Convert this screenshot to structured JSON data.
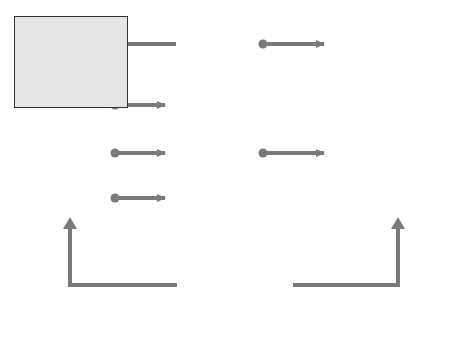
{
  "boxes": {
    "core": {
      "title_lines": [
        "CORE",
        "JOB",
        "CHARACTERISTICS"
      ],
      "items": [
        "Skill variety",
        "Task identity",
        "Task significance",
        "Autonomy",
        "Feedback"
      ]
    },
    "critical": {
      "title_lines": [
        "CRITICAL",
        "PSYCHOLOGICAL",
        "STATES"
      ],
      "items": [
        [
          "Experienced",
          "meaningfulness of",
          "the work"
        ],
        [
          "Experienced",
          "responsibility for",
          "outcomes of the work"
        ],
        [
          "Knowledge of actual",
          "results of the work"
        ]
      ]
    },
    "outcomes": {
      "title_lines": [
        "INDIVIDUAL",
        "WORK",
        "OUTCOMES"
      ],
      "items": [
        [
          "High intrinsic work",
          "motivation"
        ],
        [
          "High-quality work",
          "performance"
        ],
        [
          "High satisfaction",
          "with the work"
        ],
        [
          "Low absenteeism",
          "and turnover"
        ]
      ]
    },
    "moderators": {
      "title": "Moderators",
      "items": [
        "Growth-need strength",
        "Knowledge and skill",
        "'Context' satisfaction"
      ]
    }
  },
  "colors": {
    "box_fill": "#e6e6e6",
    "arrow": "#7a7a7a",
    "border": "#333333"
  }
}
